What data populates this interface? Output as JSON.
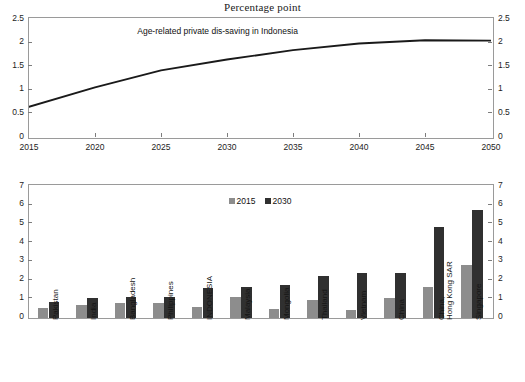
{
  "figure": {
    "title": "Percentage point"
  },
  "line_chart": {
    "annotation": "Age-related private dis-saving in Indonesia",
    "axis_left_ticks": [
      "0",
      "0.5",
      "1",
      "1.5",
      "2",
      "2.5"
    ],
    "axis_right_ticks": [
      "0",
      "0.5",
      "1",
      "1.5",
      "2",
      "2.5"
    ],
    "x_ticks": [
      "2015",
      "2020",
      "2025",
      "2030",
      "2035",
      "2040",
      "2045",
      "2050"
    ],
    "line_color": "#1a1a1a"
  },
  "bar_chart": {
    "legend": [
      {
        "label": "2015",
        "color": "#8d8d8d"
      },
      {
        "label": "2030",
        "color": "#303030"
      }
    ],
    "axis_left_ticks": [
      "0",
      "1",
      "2",
      "3",
      "4",
      "5",
      "6",
      "7"
    ],
    "axis_right_ticks": [
      "0",
      "1",
      "2",
      "3",
      "4",
      "5",
      "6",
      "7"
    ]
  },
  "chart_data": [
    {
      "type": "line",
      "title": "Percentage point",
      "annotation": "Age-related private dis-saving in Indonesia",
      "xlabel": "",
      "ylabel": "Percentage point",
      "xlim": [
        2015,
        2050
      ],
      "ylim": [
        0,
        2.5
      ],
      "ytick_values": [
        0,
        0.5,
        1,
        1.5,
        2,
        2.5
      ],
      "xtick_values": [
        2015,
        2020,
        2025,
        2030,
        2035,
        2040,
        2045,
        2050
      ],
      "grid": false,
      "legend_position": "none",
      "x": [
        2015,
        2020,
        2025,
        2030,
        2035,
        2040,
        2045,
        2050
      ],
      "series": [
        {
          "name": "Age-related private dis-saving in Indonesia",
          "color": "#1a1a1a",
          "values": [
            0.62,
            1.03,
            1.39,
            1.62,
            1.82,
            1.96,
            2.03,
            2.02
          ]
        }
      ]
    },
    {
      "type": "bar",
      "title": "",
      "xlabel": "",
      "ylabel": "Percentage point",
      "ylim": [
        0,
        7
      ],
      "ytick_values": [
        0,
        1,
        2,
        3,
        4,
        5,
        6,
        7
      ],
      "grid": false,
      "legend_position": "top-center",
      "categories": [
        "Pakistan",
        "India",
        "Bangladesh",
        "Philippines",
        "INDONESIA",
        "Malaysia",
        "Mongolia",
        "Thailand",
        "Vietnam",
        "China",
        "China,\nHong Kong SAR",
        "Singapore"
      ],
      "series": [
        {
          "name": "2015",
          "color": "#8d8d8d",
          "values": [
            0.55,
            0.72,
            0.78,
            0.78,
            0.58,
            1.1,
            0.48,
            0.95,
            0.45,
            1.05,
            1.68,
            2.82
          ]
        },
        {
          "name": "2030",
          "color": "#303030",
          "values": [
            0.87,
            1.07,
            1.1,
            1.1,
            1.6,
            1.65,
            1.75,
            2.26,
            2.4,
            2.42,
            4.85,
            5.78
          ]
        }
      ]
    }
  ]
}
